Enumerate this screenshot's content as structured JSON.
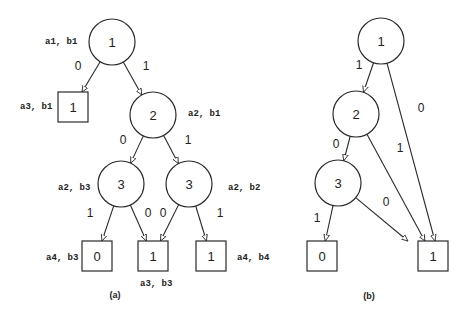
{
  "colors": {
    "stroke": "#2a2a2a",
    "background": "#ffffff"
  },
  "diagrams": [
    {
      "id": "a",
      "caption": "(a)",
      "caption_pos": [
        115,
        295
      ],
      "nodes": [
        {
          "id": "a_n1",
          "shape": "circle",
          "label": "1",
          "x": 112,
          "y": 42,
          "r": 23,
          "annotation": "a1, b1",
          "ann_pos": [
            45,
            42
          ]
        },
        {
          "id": "a_t1",
          "shape": "square",
          "label": "1",
          "x": 73,
          "y": 107,
          "s": 30,
          "annotation": "a3, b1",
          "ann_pos": [
            20,
            107
          ]
        },
        {
          "id": "a_n2",
          "shape": "circle",
          "label": "2",
          "x": 153,
          "y": 115,
          "r": 23,
          "annotation": "a2, b1",
          "ann_pos": [
            188,
            114
          ]
        },
        {
          "id": "a_n3l",
          "shape": "circle",
          "label": "3",
          "x": 121,
          "y": 184,
          "r": 23,
          "annotation": "a2, b3",
          "ann_pos": [
            58,
            188
          ]
        },
        {
          "id": "a_n3r",
          "shape": "circle",
          "label": "3",
          "x": 189,
          "y": 184,
          "r": 23,
          "annotation": "a2, b2",
          "ann_pos": [
            228,
            188
          ]
        },
        {
          "id": "a_t0",
          "shape": "square",
          "label": "0",
          "x": 97,
          "y": 256,
          "s": 30,
          "annotation": "a4, b3",
          "ann_pos": [
            46,
            258
          ]
        },
        {
          "id": "a_t1m",
          "shape": "square",
          "label": "1",
          "x": 153,
          "y": 256,
          "s": 30,
          "annotation": "a3, b3",
          "ann_pos": [
            140,
            284
          ]
        },
        {
          "id": "a_t1r",
          "shape": "square",
          "label": "1",
          "x": 211,
          "y": 256,
          "s": 30,
          "annotation": "a4, b4",
          "ann_pos": [
            237,
            258
          ]
        }
      ],
      "edges": [
        {
          "from": "a_n1",
          "to": "a_t1",
          "label": "0",
          "label_pos": [
            78,
            66
          ]
        },
        {
          "from": "a_n1",
          "to": "a_n2",
          "label": "1",
          "label_pos": [
            146,
            66
          ]
        },
        {
          "from": "a_n2",
          "to": "a_n3l",
          "label": "0",
          "label_pos": [
            123,
            140
          ]
        },
        {
          "from": "a_n2",
          "to": "a_n3r",
          "label": "1",
          "label_pos": [
            188,
            140
          ]
        },
        {
          "from": "a_n3l",
          "to": "a_t0",
          "label": "1",
          "label_pos": [
            90,
            213
          ]
        },
        {
          "from": "a_n3l",
          "to": "a_t1m",
          "label": "0",
          "label_pos": [
            148,
            213
          ]
        },
        {
          "from": "a_n3r",
          "to": "a_t1m",
          "label": "0",
          "label_pos": [
            163,
            213
          ]
        },
        {
          "from": "a_n3r",
          "to": "a_t1r",
          "label": "1",
          "label_pos": [
            220,
            213
          ]
        }
      ]
    },
    {
      "id": "b",
      "caption": "(b)",
      "caption_pos": [
        369,
        296
      ],
      "nodes": [
        {
          "id": "b_n1",
          "shape": "circle",
          "label": "1",
          "x": 381,
          "y": 41,
          "r": 23
        },
        {
          "id": "b_n2",
          "shape": "circle",
          "label": "2",
          "x": 356,
          "y": 114,
          "r": 23
        },
        {
          "id": "b_n3",
          "shape": "circle",
          "label": "3",
          "x": 338,
          "y": 183,
          "r": 23
        },
        {
          "id": "b_t0",
          "shape": "square",
          "label": "0",
          "x": 322,
          "y": 256,
          "s": 30
        },
        {
          "id": "b_t1",
          "shape": "square",
          "label": "1",
          "x": 433,
          "y": 256,
          "s": 30
        }
      ],
      "edges": [
        {
          "from": "b_n1",
          "to": "b_n2",
          "label": "1",
          "label_pos": [
            359,
            65
          ]
        },
        {
          "from": "b_n1",
          "to": "b_t1",
          "label": "0",
          "label_pos": [
            421,
            108
          ],
          "end_dx": 6
        },
        {
          "from": "b_n2",
          "to": "b_n3",
          "label": "0",
          "label_pos": [
            336,
            144
          ]
        },
        {
          "from": "b_n2",
          "to": "b_t1",
          "label": "1",
          "label_pos": [
            400,
            148
          ],
          "end_dx": 0
        },
        {
          "from": "b_n3",
          "to": "b_t0",
          "label": "1",
          "label_pos": [
            317,
            218
          ]
        },
        {
          "from": "b_n3",
          "to": "b_t1",
          "label": "0",
          "label_pos": [
            386,
            202
          ],
          "end_dx": -7
        }
      ]
    }
  ]
}
